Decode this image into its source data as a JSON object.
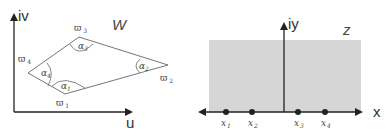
{
  "left_panel": {
    "plane_label": "W",
    "vertical_axis_label": "iv",
    "horizontal_axis_label": "u",
    "polygon": {
      "vertices": [
        {
          "name": "ϖ",
          "sub": "1",
          "x": 65,
          "y": 94,
          "label_x": 56,
          "label_y": 106
        },
        {
          "name": "ϖ",
          "sub": "2",
          "x": 168,
          "y": 65,
          "label_x": 160,
          "label_y": 81
        },
        {
          "name": "ϖ",
          "sub": "3",
          "x": 79,
          "y": 37,
          "label_x": 74,
          "label_y": 31
        },
        {
          "name": "ϖ",
          "sub": "4",
          "x": 28,
          "y": 73,
          "label_x": 18,
          "label_y": 62
        }
      ],
      "angles": [
        {
          "name": "α",
          "sub": "1",
          "x": 62,
          "y": 87
        },
        {
          "name": "α",
          "sub": "2",
          "x": 141,
          "y": 67
        },
        {
          "name": "α",
          "sub": "3",
          "x": 78,
          "y": 47
        },
        {
          "name": "α",
          "sub": "4",
          "x": 41,
          "y": 74
        }
      ]
    }
  },
  "right_panel": {
    "plane_label": "z",
    "vertical_axis_label": "iy",
    "horizontal_axis_label": "x",
    "region_fill": "#d4d4d4",
    "points": [
      {
        "name": "x",
        "sub": "1",
        "x": 226
      },
      {
        "name": "x",
        "sub": "2",
        "x": 252
      },
      {
        "name": "x",
        "sub": "3",
        "x": 298
      },
      {
        "name": "x",
        "sub": "4",
        "x": 325
      }
    ]
  },
  "colors": {
    "line": "#555555",
    "axis": "#222222",
    "text": "#444444"
  }
}
